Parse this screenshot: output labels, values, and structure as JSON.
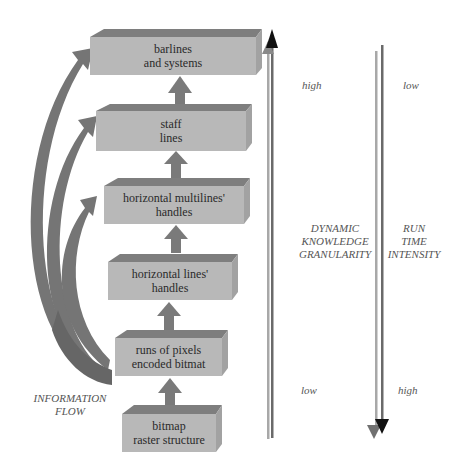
{
  "colors": {
    "box_front": "#b7b7b7",
    "box_top": "#7e7e7e",
    "box_side": "#a3a3a3",
    "arrow": "#7a7a7a",
    "flow_arrow": "#707070",
    "axis_light": "#a8a8a8",
    "axis_dark": "#5a5a5a",
    "arrowhead_dark": "#111111",
    "text": "#2a2a2a",
    "italic_text": "#555555"
  },
  "levels": [
    {
      "line1": "barlines",
      "line2": "and systems"
    },
    {
      "line1": "staff",
      "line2": "lines"
    },
    {
      "line1": "horizontal multilines'",
      "line2": "handles"
    },
    {
      "line1": "horizontal lines'",
      "line2": "handles"
    },
    {
      "line1": "runs of pixels",
      "line2": "encoded bitmat"
    },
    {
      "line1": "bitmap",
      "line2": "raster structure"
    }
  ],
  "information_flow": {
    "line1": "INFORMATION",
    "line2": "FLOW"
  },
  "knowledge_axis": {
    "title_line1": "DYNAMIC",
    "title_line2": "KNOWLEDGE",
    "title_line3": "GRANULARITY",
    "top": "high",
    "bottom": "low",
    "direction": "up"
  },
  "runtime_axis": {
    "title_line1": "RUN",
    "title_line2": "TIME",
    "title_line3": "INTENSITY",
    "top": "low",
    "bottom": "high",
    "direction": "down"
  }
}
